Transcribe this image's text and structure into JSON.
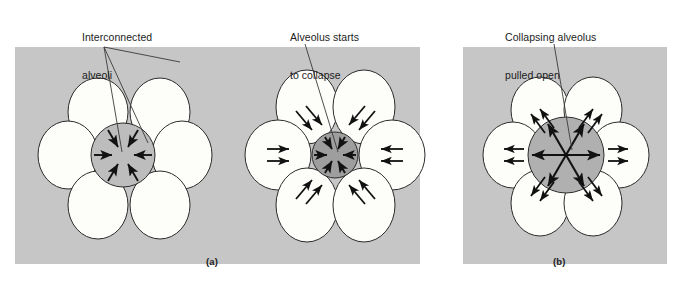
{
  "figure": {
    "title_visible": false,
    "background_color": "#ffffff",
    "panel_background_color": "#c6c6c6",
    "alveolus_fill_color": "#fdfdfa",
    "alveolus_stroke_color": "#2b2b2b",
    "center_alveolus_fill_light": "#bdbdbd",
    "center_alveolus_fill_dark": "#9e9e9e",
    "arrow_color": "#111111",
    "leader_line_color": "#3a3a3a",
    "text_color": "#1b1b1b"
  },
  "callouts": [
    {
      "id": "interconnected-alveoli",
      "line1": "Interconnected",
      "line2": "alveoli",
      "x": 82,
      "y": 6,
      "leader_style": "forked"
    },
    {
      "id": "alveolus-starts-to-collapse",
      "line1": "Alveolus starts",
      "line2": "to collapse",
      "x": 290,
      "y": 6,
      "leader_style": "single"
    },
    {
      "id": "collapsing-alveolus-pulled-open",
      "line1": "Collapsing alveolus",
      "line2": "pulled open",
      "x": 505,
      "y": 6,
      "leader_style": "single"
    }
  ],
  "panels": [
    {
      "id": "panel-a",
      "caption": "(a)",
      "caption_x": 206,
      "caption_y": 256,
      "rect": {
        "x": 15,
        "y": 47,
        "w": 405,
        "h": 217
      },
      "clusters": [
        {
          "id": "cluster-a-left",
          "cx": 122,
          "cy": 153,
          "ring_radius": 47,
          "petal_rx": 29,
          "petal_ry": 33,
          "center_radius": 32,
          "center_fill": "light",
          "center_arrows": "inward",
          "center_arrow_count": 6,
          "outer_arrows": "none"
        },
        {
          "id": "cluster-a-right",
          "cx": 334,
          "cy": 153,
          "ring_radius": 50,
          "petal_rx": 31,
          "petal_ry": 36,
          "center_radius": 23,
          "center_fill": "dark",
          "center_arrows": "inward",
          "center_arrow_count": 6,
          "outer_arrows": "outward-double",
          "outer_arrow_count": 6
        }
      ]
    },
    {
      "id": "panel-b",
      "caption": "(b)",
      "caption_x": 553,
      "caption_y": 256,
      "rect": {
        "x": 463,
        "y": 47,
        "w": 204,
        "h": 217
      },
      "clusters": [
        {
          "id": "cluster-b",
          "cx": 565,
          "cy": 153,
          "ring_radius": 47,
          "petal_rx": 29,
          "petal_ry": 33,
          "center_radius": 38,
          "center_fill": "light",
          "center_arrows": "outward",
          "center_arrow_count": 6,
          "outer_arrows": "outward-double",
          "outer_arrow_count": 6
        }
      ]
    }
  ],
  "legend_note": {
    "description": "Schematic of alveolar interdependence: inward recoil arrows in a collapsing alveolus and outward traction arrows from neighbouring alveoli holding it open."
  }
}
